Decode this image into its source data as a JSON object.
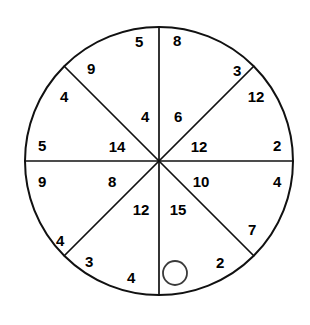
{
  "figure": {
    "name": "circle-sector-wheel",
    "type": "circle divided into eight sectors",
    "background_color": "#ffffff",
    "line_color": "#111111",
    "text_color": "#000000",
    "circle": {
      "center_x": 159,
      "center_y": 161,
      "radius": 134
    },
    "marker": {
      "name": "small-open-circle",
      "center_x": 175,
      "center_y": 273,
      "radius": 12
    },
    "radii_angles_deg": [
      0,
      45,
      90,
      135,
      180,
      225,
      270,
      315
    ],
    "labels": [
      {
        "id": "l01",
        "text": "5",
        "x": 139,
        "y": 41
      },
      {
        "id": "l02",
        "text": "8",
        "x": 177,
        "y": 40
      },
      {
        "id": "l03",
        "text": "9",
        "x": 91,
        "y": 68
      },
      {
        "id": "l04",
        "text": "3",
        "x": 237,
        "y": 70
      },
      {
        "id": "l05",
        "text": "4",
        "x": 64,
        "y": 96
      },
      {
        "id": "l06",
        "text": "12",
        "x": 256,
        "y": 96
      },
      {
        "id": "l07",
        "text": "4",
        "x": 145,
        "y": 116
      },
      {
        "id": "l08",
        "text": "6",
        "x": 178,
        "y": 116
      },
      {
        "id": "l09",
        "text": "5",
        "x": 42,
        "y": 145
      },
      {
        "id": "l10",
        "text": "14",
        "x": 117,
        "y": 146
      },
      {
        "id": "l11",
        "text": "12",
        "x": 199,
        "y": 146
      },
      {
        "id": "l12",
        "text": "2",
        "x": 277,
        "y": 145
      },
      {
        "id": "l13",
        "text": "9",
        "x": 42,
        "y": 181
      },
      {
        "id": "l14",
        "text": "8",
        "x": 112,
        "y": 181
      },
      {
        "id": "l15",
        "text": "10",
        "x": 201,
        "y": 181
      },
      {
        "id": "l16",
        "text": "4",
        "x": 277,
        "y": 181
      },
      {
        "id": "l17",
        "text": "12",
        "x": 141,
        "y": 209
      },
      {
        "id": "l18",
        "text": "15",
        "x": 178,
        "y": 209
      },
      {
        "id": "l19",
        "text": "7",
        "x": 252,
        "y": 229
      },
      {
        "id": "l20",
        "text": "4",
        "x": 60,
        "y": 240
      },
      {
        "id": "l21",
        "text": "3",
        "x": 89,
        "y": 261
      },
      {
        "id": "l22",
        "text": "2",
        "x": 220,
        "y": 262
      },
      {
        "id": "l23",
        "text": "4",
        "x": 131,
        "y": 277
      }
    ]
  }
}
